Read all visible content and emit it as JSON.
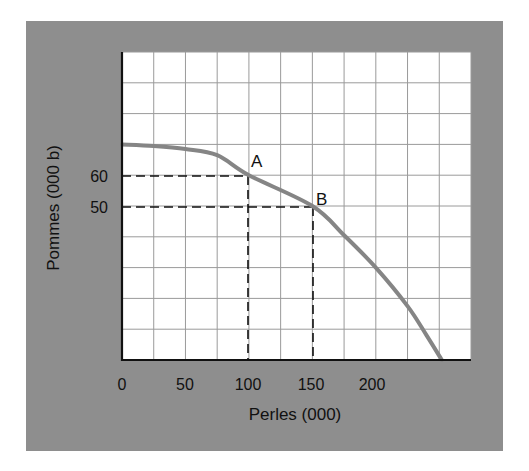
{
  "chart_data": {
    "type": "line",
    "title": "",
    "xlabel": "Perles (000)",
    "ylabel": "Pommes (000 b)",
    "xlim": [
      0,
      275
    ],
    "ylim": [
      0,
      100
    ],
    "grid": true,
    "x_ticks": [
      0,
      50,
      100,
      150,
      200
    ],
    "x_tick_labels": [
      "0",
      "50",
      "100",
      "150",
      "200"
    ],
    "y_ticks": [
      60,
      50
    ],
    "y_tick_labels": [
      "60",
      "50"
    ],
    "series": [
      {
        "name": "Production possibility frontier",
        "x": [
          0,
          25,
          50,
          75,
          100,
          150,
          175,
          200,
          225,
          240,
          252
        ],
        "y": [
          70,
          69.5,
          68.5,
          66.5,
          60,
          50,
          40.5,
          30,
          17.5,
          8,
          0
        ]
      }
    ],
    "annotations": [
      {
        "label": "A",
        "x": 100,
        "y": 60,
        "dashed_guides": true
      },
      {
        "label": "B",
        "x": 150,
        "y": 50,
        "dashed_guides": true
      }
    ],
    "colors": {
      "frame": "#8e8e8e",
      "plot_bg": "#ffffff",
      "grid": "#9a9a9a",
      "curve": "#858585",
      "axis": "#111111"
    }
  },
  "labels": {
    "x_axis": "Perles (000)",
    "y_axis": "Pommes (000 b)",
    "point_a": "A",
    "point_b": "B",
    "x_ticks": [
      "0",
      "50",
      "100",
      "150",
      "200"
    ],
    "y_ticks": [
      "60",
      "50"
    ]
  }
}
